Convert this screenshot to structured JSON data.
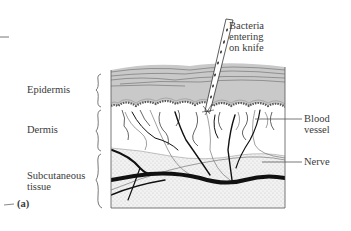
{
  "figure": {
    "panel_label": "(a)",
    "layers": [
      {
        "id": "epidermis",
        "label": "Epidermis"
      },
      {
        "id": "dermis",
        "label": "Dermis"
      },
      {
        "id": "subcutaneous",
        "label": "Subcutaneous tissue",
        "lines": [
          "Subcutaneous",
          "tissue"
        ]
      }
    ],
    "callouts": {
      "knife": {
        "lines": [
          "Bacteria",
          "entering",
          "on knife"
        ]
      },
      "blood_vessel": {
        "lines": [
          "Blood",
          "vessel"
        ]
      },
      "nerve": {
        "label": "Nerve"
      }
    },
    "colors": {
      "epidermis_fill": "#c9c9c9",
      "stratum_lines": "#6a6a6a",
      "vessel": "#111111",
      "nerve": "#777777",
      "subcutaneous_stipple": "#d8d8d8",
      "outline": "#555555"
    }
  }
}
